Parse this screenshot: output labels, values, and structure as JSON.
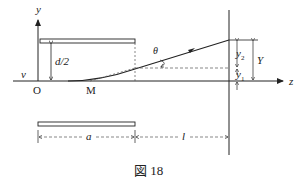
{
  "figure": {
    "caption": "図 18",
    "labels": {
      "y_axis": "y",
      "z_axis": "z",
      "origin": "O",
      "velocity": "v",
      "half_gap": "d/2",
      "exit_point": "M",
      "angle": "θ",
      "deflection_1": "y",
      "deflection_1_sub": "1",
      "deflection_2": "y",
      "deflection_2_sub": "2",
      "total_deflection": "Y",
      "plate_length": "a",
      "screen_distance": "l"
    },
    "colors": {
      "line": "#222222",
      "dashed": "#555555",
      "background": "#ffffff"
    }
  }
}
